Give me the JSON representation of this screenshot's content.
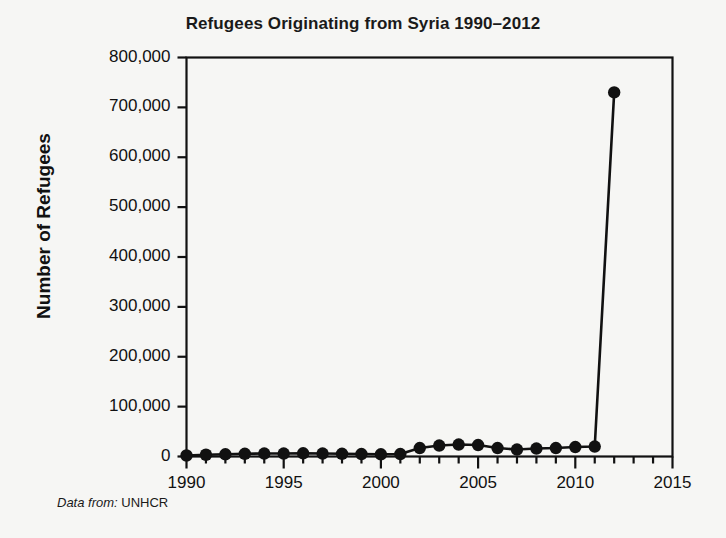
{
  "chart_data": {
    "type": "line",
    "title": "Refugees Originating from Syria 1990–2012",
    "xlabel": "",
    "ylabel": "Number of Refugees",
    "xlim": [
      1990,
      2015
    ],
    "ylim": [
      0,
      800000
    ],
    "grid": false,
    "legend": null,
    "x_major_ticks": [
      1990,
      1995,
      2000,
      2005,
      2010,
      2015
    ],
    "x_tick_labels": [
      "1990",
      "1995",
      "2000",
      "2005",
      "2010",
      "2015"
    ],
    "x_minor_tick_step": 1,
    "y_ticks": [
      0,
      100000,
      200000,
      300000,
      400000,
      500000,
      600000,
      700000,
      800000
    ],
    "y_tick_labels": [
      "0",
      "100,000",
      "200,000",
      "300,000",
      "400,000",
      "500,000",
      "600,000",
      "700,000",
      "800,000"
    ],
    "marker": "filled-circle",
    "line_color": "#111111",
    "marker_color": "#111111",
    "x": [
      1990,
      1991,
      1992,
      1993,
      1994,
      1995,
      1996,
      1997,
      1998,
      1999,
      2000,
      2001,
      2002,
      2003,
      2004,
      2005,
      2006,
      2007,
      2008,
      2009,
      2010,
      2011,
      2012
    ],
    "values": [
      2000,
      3500,
      4500,
      5500,
      6000,
      6000,
      6500,
      6000,
      5500,
      5000,
      4500,
      5000,
      17000,
      22000,
      24000,
      23000,
      17000,
      14000,
      16000,
      17000,
      19000,
      20000,
      730000
    ],
    "annotations": []
  },
  "caption": {
    "key": "Data from:",
    "value": " UNHCR"
  },
  "figure": {
    "background_color": "#f6f6f4",
    "axis_color": "#111111"
  }
}
